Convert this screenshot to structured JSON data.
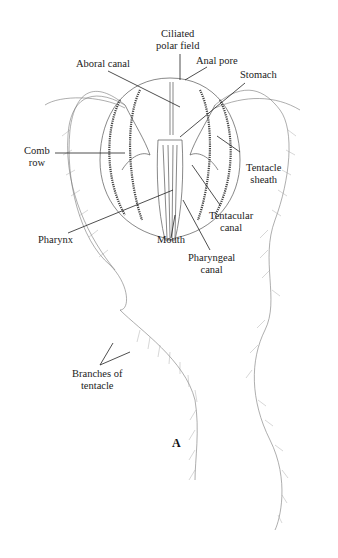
{
  "figure": {
    "panel_label": "A",
    "labels": {
      "ciliated_polar_field_1": "Ciliated",
      "ciliated_polar_field_2": "polar field",
      "anal_pore": "Anal pore",
      "aboral_canal": "Aboral canal",
      "stomach": "Stomach",
      "comb_row_1": "Comb",
      "comb_row_2": "row",
      "tentacle_sheath_1": "Tentacle",
      "tentacle_sheath_2": "sheath",
      "tentacular_canal_1": "Tentacular",
      "tentacular_canal_2": "canal",
      "pharynx": "Pharynx",
      "mouth": "Mouth",
      "pharyngeal_canal_1": "Pharyngeal",
      "pharyngeal_canal_2": "canal",
      "branches_1": "Branches of",
      "branches_2": "tentacle"
    }
  }
}
